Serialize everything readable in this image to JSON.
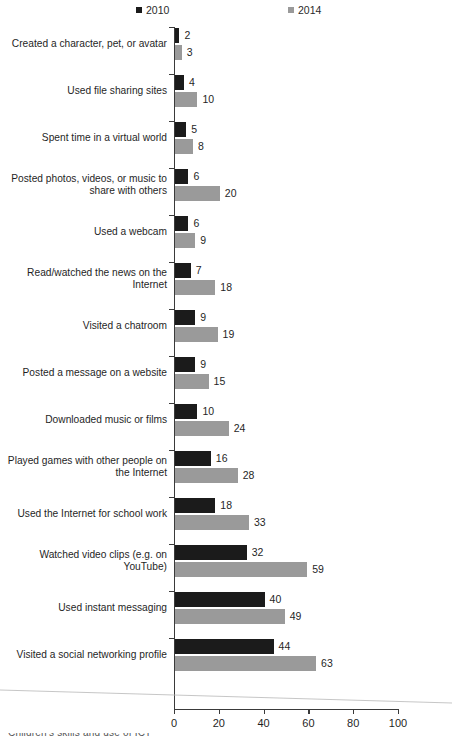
{
  "chart_data": {
    "type": "bar",
    "orientation": "horizontal",
    "title": "",
    "xlabel": "",
    "ylabel": "",
    "xlim": [
      0,
      100
    ],
    "xticks": [
      0,
      20,
      40,
      60,
      80,
      100
    ],
    "grid": false,
    "legend_position": "top",
    "categories": [
      "Created a character, pet, or avatar",
      "Used file sharing sites",
      "Spent time in a virtual world",
      "Posted photos, videos, or music to share with others",
      "Used a webcam",
      "Read/watched the news on the Internet",
      "Visited a chatroom",
      "Posted a message on a website",
      "Downloaded music or films",
      "Played games with other people on the Internet",
      "Used the Internet for school work",
      "Watched video clips (e.g. on YouTube)",
      "Used instant messaging",
      "Visited a social networking profile"
    ],
    "category_lines": [
      [
        "Created a character, pet, or avatar"
      ],
      [
        "Used file sharing sites"
      ],
      [
        "Spent time in a virtual world"
      ],
      [
        "Posted photos, videos, or music to",
        "share with others"
      ],
      [
        "Used a webcam"
      ],
      [
        "Read/watched the news on the",
        "Internet"
      ],
      [
        "Visited a chatroom"
      ],
      [
        "Posted a message on a website"
      ],
      [
        "Downloaded music or films"
      ],
      [
        "Played games with other people on",
        "the Internet"
      ],
      [
        "Used the Internet for school work"
      ],
      [
        "Watched video clips (e.g. on",
        "YouTube)"
      ],
      [
        "Used instant messaging"
      ],
      [
        "Visited a social networking profile"
      ]
    ],
    "series": [
      {
        "name": "2010",
        "color": "#1b1b1b",
        "values": [
          2,
          4,
          5,
          6,
          6,
          7,
          9,
          9,
          10,
          16,
          18,
          32,
          40,
          44
        ]
      },
      {
        "name": "2014",
        "color": "#9a9a9a",
        "values": [
          3,
          10,
          8,
          20,
          9,
          18,
          19,
          15,
          24,
          28,
          33,
          59,
          49,
          63
        ]
      }
    ]
  },
  "legend": {
    "entries": [
      {
        "label": "2010",
        "color": "#1b1b1b"
      },
      {
        "label": "2014",
        "color": "#9a9a9a"
      }
    ]
  },
  "axis": {
    "tick_labels": [
      "0",
      "20",
      "40",
      "60",
      "80",
      "100"
    ]
  },
  "artifacts": {
    "bottom_clipped_text": "Children's skills and use of ICT"
  }
}
